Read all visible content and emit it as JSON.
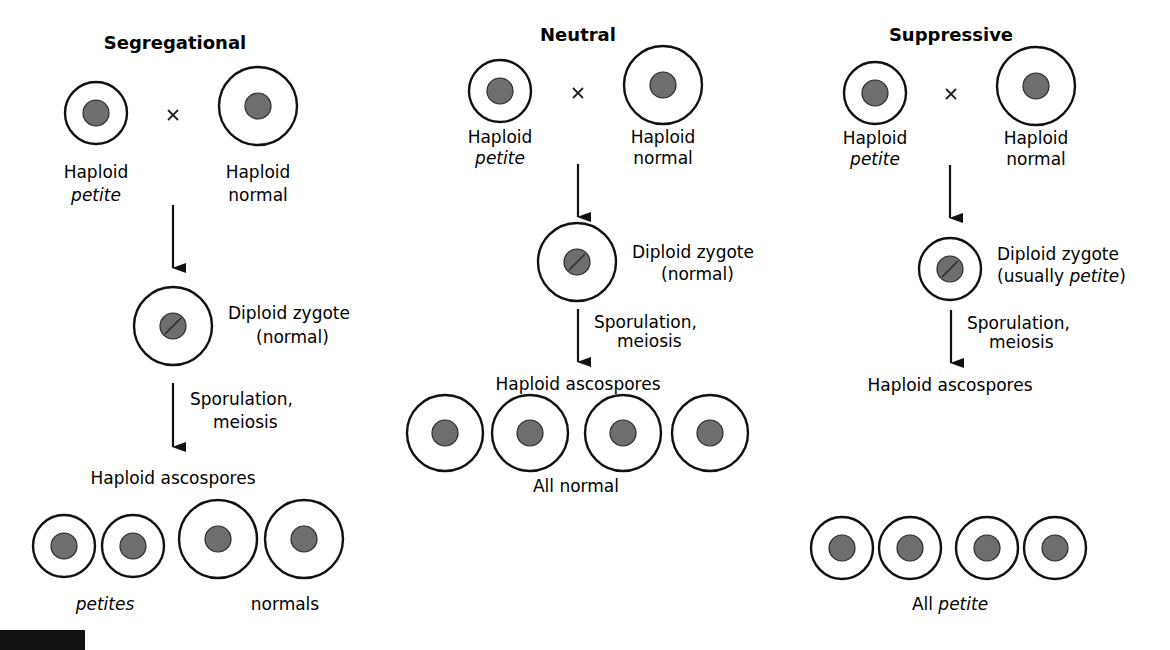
{
  "colors": {
    "cell_outline": "#111111",
    "nucleus_fill": "#6e6e6e",
    "background": "#ffffff"
  },
  "cross_symbol": "×",
  "columns": [
    {
      "id": "segregational",
      "title": "Segregational",
      "parent_petite": {
        "line1": "Haploid",
        "line2": "petite"
      },
      "parent_normal": {
        "line1": "Haploid",
        "line2": "normal"
      },
      "zygote": {
        "line1": "Diploid zygote",
        "line2": "(normal)"
      },
      "process": {
        "line1": "Sporulation,",
        "line2": "meiosis"
      },
      "ascospores_label": "Haploid ascospores",
      "result_labels": [
        "petites",
        "normals"
      ],
      "spores": [
        "petite",
        "petite",
        "normal",
        "normal"
      ]
    },
    {
      "id": "neutral",
      "title": "Neutral",
      "parent_petite": {
        "line1": "Haploid",
        "line2": "petite"
      },
      "parent_normal": {
        "line1": "Haploid",
        "line2": "normal"
      },
      "zygote": {
        "line1": "Diploid zygote",
        "line2": "(normal)"
      },
      "process": {
        "line1": "Sporulation,",
        "line2": "meiosis"
      },
      "ascospores_label": "Haploid ascospores",
      "result_label": "All normal",
      "spores": [
        "normal",
        "normal",
        "normal",
        "normal"
      ]
    },
    {
      "id": "suppressive",
      "title": "Suppressive",
      "parent_petite": {
        "line1": "Haploid",
        "line2": "petite"
      },
      "parent_normal": {
        "line1": "Haploid",
        "line2": "normal"
      },
      "zygote": {
        "line1": "Diploid zygote",
        "line2_prefix": "(usually ",
        "line2_italic": "petite",
        "line2_suffix": ")"
      },
      "process": {
        "line1": "Sporulation,",
        "line2": "meiosis"
      },
      "ascospores_label": "Haploid ascospores",
      "result_label_prefix": "All ",
      "result_label_italic": "petite",
      "spores": [
        "petite",
        "petite",
        "petite",
        "petite"
      ]
    }
  ]
}
